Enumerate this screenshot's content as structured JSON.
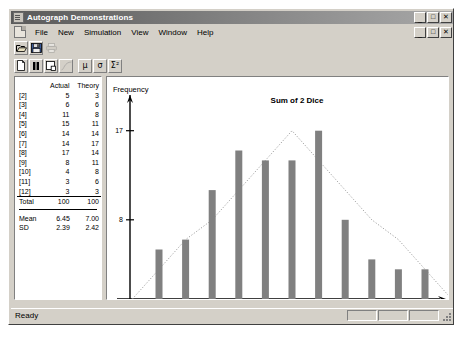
{
  "window": {
    "title": "Autograph Demonstrations",
    "app_icon": "app-window-icon",
    "buttons": {
      "minimize": "_",
      "maximize": "□",
      "close": "✕"
    }
  },
  "menu": {
    "doc_icon": "document-icon",
    "items": [
      {
        "label": "File",
        "accel": "F"
      },
      {
        "label": "New",
        "accel": "N"
      },
      {
        "label": "Simulation",
        "accel": "S"
      },
      {
        "label": "View",
        "accel": "V"
      },
      {
        "label": "Window",
        "accel": "W"
      },
      {
        "label": "Help",
        "accel": "H"
      }
    ]
  },
  "toolbar_file": [
    {
      "name": "open-icon",
      "label": "Open"
    },
    {
      "name": "save-icon",
      "label": "Save"
    },
    {
      "name": "print-icon",
      "label": "Print"
    }
  ],
  "toolbar_sim": [
    {
      "name": "new-page-icon",
      "label": "New Page"
    },
    {
      "name": "pause-icon",
      "label": "Pause"
    },
    {
      "name": "window-icon",
      "label": "Window"
    },
    {
      "name": "curve-icon",
      "label": "Curve"
    },
    {
      "name": "mean-icon",
      "label": "μ"
    },
    {
      "name": "sigma-icon",
      "label": "σ"
    },
    {
      "name": "chi-squared-icon",
      "label": "Σ²"
    }
  ],
  "data_table": {
    "columns": [
      "",
      "Actual",
      "Theory"
    ],
    "rows": [
      {
        "label": "[2]",
        "actual": "5",
        "theory": "3"
      },
      {
        "label": "[3]",
        "actual": "6",
        "theory": "6"
      },
      {
        "label": "[4]",
        "actual": "11",
        "theory": "8"
      },
      {
        "label": "[5]",
        "actual": "15",
        "theory": "11"
      },
      {
        "label": "[6]",
        "actual": "14",
        "theory": "14"
      },
      {
        "label": "[7]",
        "actual": "14",
        "theory": "17"
      },
      {
        "label": "[8]",
        "actual": "17",
        "theory": "14"
      },
      {
        "label": "[9]",
        "actual": "8",
        "theory": "11"
      },
      {
        "label": "[10]",
        "actual": "4",
        "theory": "8"
      },
      {
        "label": "[11]",
        "actual": "3",
        "theory": "6"
      },
      {
        "label": "[12]",
        "actual": "3",
        "theory": "3"
      }
    ],
    "total": {
      "label": "Total",
      "actual": "100",
      "theory": "100"
    },
    "summary": [
      {
        "label": "Mean",
        "actual": "6.45",
        "theory": "7.00"
      },
      {
        "label": "SD",
        "actual": "2.39",
        "theory": "2.42"
      }
    ]
  },
  "chart_data": {
    "type": "bar",
    "title": "Sum of 2 Dice",
    "xlabel": "",
    "ylabel": "Frequency",
    "categories": [
      2,
      3,
      4,
      5,
      6,
      7,
      8,
      9,
      10,
      11,
      12
    ],
    "tick_labels_x": [
      "2",
      "3",
      "4",
      "5",
      "6",
      "7",
      "8",
      "9",
      "10",
      "11",
      "12"
    ],
    "tick_labels_y": [
      "8",
      "17"
    ],
    "yticks": [
      8,
      17
    ],
    "ylim": [
      0,
      20
    ],
    "grid": false,
    "legend": "none",
    "series": [
      {
        "name": "Actual",
        "render": "bar",
        "color": "#808080",
        "values": [
          5,
          6,
          11,
          15,
          14,
          14,
          17,
          8,
          4,
          3,
          3
        ]
      },
      {
        "name": "Theory",
        "render": "dotted-line",
        "color": "#a0a0a0",
        "values": [
          3,
          6,
          8,
          11,
          14,
          17,
          14,
          11,
          8,
          6,
          3
        ]
      }
    ]
  },
  "status": {
    "text": "Ready",
    "panes": [
      "",
      "",
      ""
    ]
  }
}
